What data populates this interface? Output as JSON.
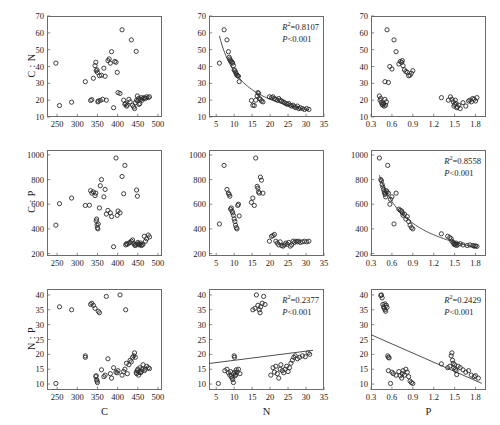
{
  "figure": {
    "caption": "",
    "marker": "open-circle",
    "grid": false
  },
  "chart_data": [
    {
      "id": "cn_vs_c",
      "type": "scatter",
      "title": "",
      "xlabel": "C",
      "ylabel": "C : N",
      "xlim": [
        225,
        510
      ],
      "ylim": [
        10,
        70
      ],
      "xticks": [
        250,
        300,
        350,
        400,
        450,
        500
      ],
      "yticks": [
        10,
        20,
        30,
        40,
        50,
        60,
        70
      ],
      "grid": false,
      "regression": null,
      "x": [
        247,
        256,
        286,
        320,
        333,
        336,
        340,
        344,
        346,
        347,
        349,
        350,
        351,
        352,
        355,
        357,
        360,
        363,
        366,
        369,
        372,
        376,
        379,
        382,
        385,
        390,
        393,
        396,
        399,
        401,
        406,
        411,
        415,
        418,
        420,
        422,
        424,
        428,
        431,
        434,
        437,
        440,
        442,
        444,
        446,
        447,
        449,
        450,
        452,
        453,
        455,
        457,
        459,
        461,
        463,
        466,
        469,
        472,
        476,
        479
      ],
      "y": [
        42.0,
        16.8,
        18.8,
        31.0,
        19.8,
        20.3,
        33.0,
        40.5,
        42.5,
        37.5,
        38.0,
        36.5,
        19.0,
        19.5,
        34.5,
        19.8,
        34.8,
        20.5,
        39.0,
        34.2,
        20.0,
        43.5,
        44.5,
        42.0,
        48.8,
        15.5,
        43.0,
        42.5,
        36.5,
        24.5,
        24.0,
        61.8,
        20.0,
        17.5,
        18.0,
        16.5,
        17.0,
        20.5,
        19.0,
        55.8,
        17.0,
        16.0,
        15.0,
        18.5,
        49.0,
        20.0,
        22.5,
        19.5,
        21.0,
        17.5,
        18.0,
        20.5,
        21.5,
        20.0,
        21.0,
        21.5,
        21.0,
        22.0,
        21.5,
        22.0
      ]
    },
    {
      "id": "cn_vs_n",
      "type": "scatter",
      "title": "",
      "xlabel": "N",
      "ylabel": "C : N",
      "xlim": [
        3,
        35
      ],
      "ylim": [
        10,
        70
      ],
      "xticks": [
        5,
        10,
        15,
        20,
        25,
        30,
        35
      ],
      "yticks": [
        10,
        20,
        30,
        40,
        50,
        60,
        70
      ],
      "grid": false,
      "regression": {
        "r2_label": "R",
        "r2_value": "=0.8107",
        "p_value": "P<0.001",
        "type": "power"
      },
      "x": [
        5.9,
        7.2,
        8.0,
        8.4,
        8.6,
        8.8,
        9.0,
        9.2,
        9.4,
        9.6,
        9.8,
        10.0,
        10.2,
        10.4,
        10.6,
        10.8,
        11.0,
        11.2,
        11.4,
        14.8,
        15.2,
        15.6,
        16.0,
        16.4,
        16.6,
        16.8,
        17.0,
        17.3,
        17.6,
        18.0,
        19.8,
        20.4,
        20.8,
        21.2,
        21.6,
        22.0,
        22.4,
        22.8,
        23.2,
        23.6,
        24.0,
        24.4,
        24.8,
        25.2,
        25.6,
        26.0,
        26.4,
        26.8,
        27.2,
        27.6,
        28.0,
        28.4,
        29.0,
        29.6,
        30.2,
        30.8
      ],
      "y": [
        42.0,
        61.8,
        55.8,
        48.8,
        45.5,
        44.5,
        43.5,
        43.0,
        42.5,
        42.0,
        40.5,
        38.0,
        37.5,
        36.5,
        35.5,
        34.8,
        34.5,
        34.2,
        31.0,
        19.8,
        17.0,
        16.8,
        20.0,
        22.5,
        24.5,
        24.0,
        21.0,
        20.5,
        19.5,
        19.0,
        22.0,
        21.5,
        22.0,
        21.0,
        20.5,
        20.0,
        21.0,
        20.0,
        19.5,
        19.0,
        18.5,
        18.0,
        17.5,
        18.0,
        17.0,
        16.5,
        17.0,
        16.0,
        15.5,
        16.5,
        15.0,
        15.5,
        15.0,
        14.5,
        15.0,
        14.5
      ]
    },
    {
      "id": "cn_vs_p",
      "type": "scatter",
      "title": "",
      "xlabel": "P",
      "ylabel": "C : N",
      "xlim": [
        0.3,
        1.95
      ],
      "ylim": [
        10,
        70
      ],
      "xticks": [
        0.3,
        0.6,
        0.9,
        1.2,
        1.5,
        1.8
      ],
      "yticks": [
        10,
        20,
        30,
        40,
        50,
        60,
        70
      ],
      "grid": false,
      "regression": null,
      "x": [
        0.42,
        0.43,
        0.44,
        0.45,
        0.46,
        0.47,
        0.48,
        0.49,
        0.5,
        0.5,
        0.51,
        0.52,
        0.53,
        0.55,
        0.57,
        0.6,
        0.63,
        0.66,
        0.7,
        0.72,
        0.74,
        0.75,
        0.76,
        0.78,
        0.8,
        0.82,
        0.84,
        0.86,
        0.88,
        0.9,
        1.31,
        1.41,
        1.44,
        1.46,
        1.48,
        1.49,
        1.5,
        1.51,
        1.52,
        1.53,
        1.54,
        1.56,
        1.58,
        1.62,
        1.66,
        1.7,
        1.72,
        1.74,
        1.76,
        1.78,
        1.8,
        1.82
      ],
      "y": [
        22.5,
        20.0,
        21.0,
        18.5,
        17.5,
        17.0,
        18.0,
        16.5,
        20.5,
        31.0,
        17.0,
        19.0,
        61.8,
        30.5,
        40.0,
        38.5,
        55.8,
        48.8,
        41.5,
        43.0,
        42.5,
        43.5,
        40.5,
        38.0,
        37.0,
        36.5,
        34.5,
        34.8,
        36.0,
        37.5,
        21.5,
        20.0,
        22.0,
        20.5,
        19.0,
        16.5,
        17.5,
        20.0,
        18.0,
        15.5,
        16.0,
        17.0,
        15.0,
        18.5,
        16.5,
        19.5,
        20.0,
        19.0,
        21.0,
        20.5,
        19.5,
        21.5
      ]
    },
    {
      "id": "cp_vs_c",
      "type": "scatter",
      "title": "",
      "xlabel": "C",
      "ylabel": "C : P",
      "xlim": [
        225,
        510
      ],
      "ylim": [
        180,
        1040
      ],
      "xticks": [
        250,
        300,
        350,
        400,
        450,
        500
      ],
      "yticks": [
        200,
        400,
        600,
        800,
        1000
      ],
      "grid": false,
      "regression": null,
      "x": [
        247,
        256,
        286,
        320,
        330,
        333,
        336,
        340,
        344,
        346,
        347,
        348,
        349,
        350,
        351,
        352,
        355,
        357,
        360,
        366,
        369,
        372,
        376,
        382,
        385,
        390,
        396,
        399,
        401,
        406,
        411,
        415,
        418,
        420,
        422,
        424,
        428,
        431,
        434,
        437,
        440,
        442,
        444,
        446,
        447,
        449,
        450,
        452,
        453,
        455,
        457,
        459,
        461,
        463,
        466,
        469,
        472,
        476,
        479
      ],
      "y": [
        430,
        605,
        650,
        590,
        592,
        710,
        690,
        700,
        670,
        690,
        465,
        480,
        430,
        410,
        400,
        440,
        570,
        750,
        800,
        660,
        720,
        520,
        550,
        530,
        500,
        255,
        975,
        510,
        545,
        530,
        825,
        685,
        915,
        270,
        280,
        275,
        285,
        290,
        300,
        310,
        280,
        270,
        265,
        275,
        715,
        665,
        290,
        280,
        270,
        275,
        285,
        265,
        270,
        275,
        340,
        300,
        320,
        350,
        335
      ]
    },
    {
      "id": "cp_vs_n",
      "type": "scatter",
      "title": "",
      "xlabel": "N",
      "ylabel": "C : P",
      "xlim": [
        3,
        35
      ],
      "ylim": [
        180,
        1040
      ],
      "xticks": [
        5,
        10,
        15,
        20,
        25,
        30,
        35
      ],
      "yticks": [
        200,
        400,
        600,
        800,
        1000
      ],
      "grid": false,
      "regression": null,
      "x": [
        5.9,
        7.2,
        8.0,
        8.4,
        8.6,
        8.8,
        9.0,
        9.2,
        9.4,
        9.6,
        9.8,
        10.0,
        10.2,
        10.4,
        10.6,
        10.8,
        11.0,
        11.2,
        11.4,
        14.8,
        15.2,
        15.6,
        16.0,
        16.4,
        16.6,
        16.8,
        17.0,
        17.3,
        17.6,
        18.0,
        19.8,
        20.4,
        20.8,
        21.2,
        21.6,
        22.0,
        22.4,
        22.8,
        23.2,
        23.6,
        24.0,
        24.4,
        24.8,
        25.2,
        25.6,
        26.0,
        26.4,
        26.8,
        27.2,
        27.6,
        28.0,
        28.4,
        29.0,
        29.6,
        30.2,
        30.8
      ],
      "y": [
        440,
        915,
        720,
        690,
        680,
        665,
        560,
        570,
        545,
        530,
        510,
        480,
        460,
        430,
        410,
        400,
        590,
        600,
        505,
        615,
        650,
        590,
        975,
        745,
        730,
        700,
        690,
        820,
        795,
        690,
        300,
        340,
        345,
        355,
        300,
        285,
        270,
        295,
        265,
        260,
        270,
        285,
        275,
        290,
        260,
        270,
        300,
        290,
        300,
        295,
        300,
        290,
        295,
        300,
        295,
        300
      ]
    },
    {
      "id": "cp_vs_p",
      "type": "scatter",
      "title": "",
      "xlabel": "P",
      "ylabel": "C : P",
      "xlim": [
        0.3,
        1.95
      ],
      "ylim": [
        180,
        1040
      ],
      "xticks": [
        0.3,
        0.6,
        0.9,
        1.2,
        1.5,
        1.8
      ],
      "yticks": [
        200,
        400,
        600,
        800,
        1000
      ],
      "grid": false,
      "regression": {
        "r2_label": "R",
        "r2_value": "=0.8558",
        "p_value": "P<0.001",
        "type": "power"
      },
      "x": [
        0.42,
        0.44,
        0.45,
        0.46,
        0.47,
        0.48,
        0.49,
        0.5,
        0.5,
        0.51,
        0.52,
        0.53,
        0.54,
        0.55,
        0.57,
        0.58,
        0.6,
        0.63,
        0.66,
        0.7,
        0.72,
        0.74,
        0.75,
        0.76,
        0.78,
        0.8,
        0.82,
        0.84,
        0.86,
        0.88,
        0.9,
        1.31,
        1.4,
        1.43,
        1.45,
        1.46,
        1.48,
        1.49,
        1.5,
        1.51,
        1.52,
        1.53,
        1.55,
        1.58,
        1.62,
        1.68,
        1.72,
        1.76,
        1.78,
        1.8,
        1.82
      ],
      "y": [
        975,
        800,
        790,
        760,
        740,
        720,
        700,
        690,
        680,
        660,
        710,
        700,
        915,
        690,
        600,
        640,
        660,
        440,
        690,
        560,
        550,
        545,
        530,
        510,
        520,
        480,
        500,
        460,
        430,
        410,
        400,
        360,
        340,
        330,
        320,
        300,
        290,
        275,
        280,
        270,
        285,
        265,
        275,
        280,
        270,
        265,
        270,
        265,
        260,
        262,
        258
      ]
    },
    {
      "id": "np_vs_c",
      "type": "scatter",
      "title": "",
      "xlabel": "C",
      "ylabel": "N : P",
      "xlim": [
        225,
        510
      ],
      "ylim": [
        8,
        42
      ],
      "xticks": [
        250,
        300,
        350,
        400,
        450,
        500
      ],
      "yticks": [
        10,
        15,
        20,
        25,
        30,
        35,
        40
      ],
      "grid": false,
      "regression": null,
      "x": [
        247,
        256,
        286,
        320,
        320,
        333,
        336,
        340,
        344,
        346,
        347,
        348,
        349,
        350,
        352,
        355,
        360,
        366,
        369,
        372,
        376,
        382,
        385,
        390,
        396,
        399,
        401,
        406,
        411,
        415,
        418,
        420,
        422,
        424,
        428,
        431,
        434,
        437,
        440,
        442,
        444,
        446,
        447,
        449,
        450,
        452,
        453,
        455,
        457,
        459,
        461,
        463,
        466,
        469,
        472,
        476,
        479
      ],
      "y": [
        10.2,
        36.0,
        35.0,
        19.5,
        19.0,
        36.8,
        37.2,
        36.5,
        35.5,
        12.5,
        12.8,
        11.5,
        11.0,
        10.5,
        34.5,
        34.0,
        14.8,
        12.5,
        13.0,
        39.5,
        18.5,
        13.5,
        12.0,
        15.5,
        14.0,
        13.8,
        14.5,
        40.0,
        13.0,
        14.2,
        15.0,
        35.0,
        17.0,
        13.5,
        16.5,
        18.0,
        17.5,
        19.0,
        19.5,
        20.5,
        19.0,
        14.0,
        13.5,
        14.5,
        15.0,
        13.0,
        14.0,
        15.5,
        13.8,
        14.2,
        15.0,
        16.5,
        14.5,
        15.0,
        16.0,
        15.5,
        15.2
      ]
    },
    {
      "id": "np_vs_n",
      "type": "scatter",
      "title": "",
      "xlabel": "N",
      "ylabel": "N : P",
      "xlim": [
        3,
        35
      ],
      "ylim": [
        8,
        42
      ],
      "xticks": [
        5,
        10,
        15,
        20,
        25,
        30,
        35
      ],
      "yticks": [
        10,
        15,
        20,
        25,
        30,
        35,
        40
      ],
      "grid": false,
      "regression": {
        "r2_label": "R",
        "r2_value": "=0.2377",
        "p_value": "P<0.001",
        "type": "linear"
      },
      "x": [
        5.6,
        7.4,
        8.0,
        8.4,
        8.8,
        9.0,
        9.2,
        9.4,
        9.6,
        9.8,
        9.9,
        10.0,
        10.1,
        10.2,
        10.3,
        10.4,
        10.6,
        10.8,
        11.2,
        11.6,
        15.2,
        15.8,
        16.2,
        16.6,
        17.0,
        17.2,
        17.4,
        17.8,
        18.2,
        18.6,
        20.2,
        20.8,
        21.2,
        21.6,
        22.0,
        22.4,
        22.8,
        23.0,
        23.4,
        23.8,
        24.2,
        24.6,
        25.0,
        25.4,
        25.8,
        26.2,
        26.6,
        27.0,
        27.6,
        28.2,
        29.0,
        29.8,
        30.6,
        31.0
      ],
      "y": [
        10.2,
        14.5,
        15.0,
        13.8,
        13.0,
        14.2,
        12.5,
        12.0,
        11.5,
        10.5,
        13.5,
        19.5,
        19.0,
        14.0,
        12.8,
        13.2,
        14.8,
        14.0,
        15.0,
        13.5,
        35.0,
        35.5,
        40.0,
        36.5,
        35.0,
        34.0,
        36.0,
        37.2,
        39.5,
        36.8,
        13.0,
        15.5,
        14.0,
        16.0,
        13.5,
        12.0,
        15.0,
        16.5,
        14.5,
        13.8,
        15.0,
        16.0,
        14.2,
        15.5,
        17.0,
        18.0,
        19.0,
        19.5,
        18.5,
        19.0,
        19.5,
        19.2,
        20.5,
        20.0
      ]
    },
    {
      "id": "np_vs_p",
      "type": "scatter",
      "title": "",
      "xlabel": "P",
      "ylabel": "N : P",
      "xlim": [
        0.3,
        1.95
      ],
      "ylim": [
        8,
        42
      ],
      "xticks": [
        0.3,
        0.6,
        0.9,
        1.2,
        1.5,
        1.8
      ],
      "yticks": [
        10,
        15,
        20,
        25,
        30,
        35,
        40
      ],
      "grid": false,
      "regression": {
        "r2_label": "R",
        "r2_value": "=0.2429",
        "p_value": "P<0.001",
        "type": "linear"
      },
      "x": [
        0.44,
        0.45,
        0.46,
        0.47,
        0.48,
        0.49,
        0.5,
        0.5,
        0.51,
        0.52,
        0.53,
        0.54,
        0.55,
        0.55,
        0.56,
        0.58,
        0.6,
        0.62,
        0.66,
        0.7,
        0.72,
        0.74,
        0.75,
        0.76,
        0.78,
        0.8,
        0.82,
        0.84,
        0.86,
        0.88,
        0.9,
        1.31,
        1.4,
        1.43,
        1.45,
        1.46,
        1.47,
        1.48,
        1.49,
        1.5,
        1.51,
        1.52,
        1.53,
        1.55,
        1.58,
        1.62,
        1.66,
        1.7,
        1.74,
        1.78,
        1.8,
        1.84
      ],
      "y": [
        39.8,
        40.0,
        39.0,
        36.8,
        36.0,
        35.5,
        37.0,
        35.0,
        34.5,
        36.5,
        35.8,
        19.5,
        19.0,
        14.5,
        18.8,
        10.2,
        14.0,
        13.5,
        13.0,
        14.2,
        12.8,
        12.0,
        13.5,
        14.5,
        13.0,
        15.0,
        14.0,
        12.5,
        11.0,
        10.5,
        10.2,
        16.8,
        15.5,
        16.0,
        19.5,
        20.5,
        18.0,
        17.0,
        15.5,
        16.5,
        15.0,
        14.5,
        13.2,
        16.0,
        15.5,
        14.8,
        14.0,
        14.5,
        13.0,
        12.5,
        12.8,
        12.0
      ]
    }
  ]
}
